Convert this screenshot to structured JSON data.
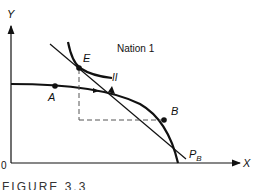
{
  "diagram": {
    "title": "Nation 1",
    "axes": {
      "x_label": "X",
      "y_label": "Y",
      "origin_label": "0"
    },
    "points": {
      "A": "A",
      "B": "B",
      "E": "E"
    },
    "curves": {
      "indifference_curve_label": "II",
      "price_line_label_main": "P",
      "price_line_label_sub": "B"
    },
    "caption": "FIGURE 3.3"
  },
  "colors": {
    "ink": "#111111",
    "dashed": "#555555",
    "background": "#ffffff"
  }
}
